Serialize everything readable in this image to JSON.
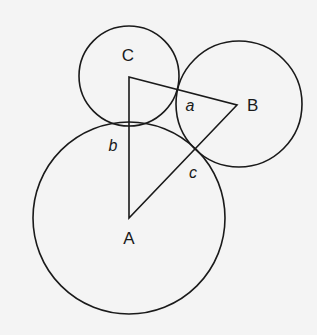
{
  "diagram": {
    "vertices": {
      "A": {
        "label": "A",
        "x": 129,
        "y": 218
      },
      "B": {
        "label": "B",
        "x": 237,
        "y": 105
      },
      "C": {
        "label": "C",
        "x": 129,
        "y": 77
      }
    },
    "circles": [
      {
        "name": "circle-a",
        "center": "A",
        "cx": 129,
        "cy": 218,
        "r": 96
      },
      {
        "name": "circle-b",
        "center": "B",
        "cx": 239,
        "cy": 104,
        "r": 63
      },
      {
        "name": "circle-c",
        "center": "C",
        "cx": 129,
        "cy": 76,
        "r": 50
      }
    ],
    "radius_labels": {
      "a": "a",
      "b": "b",
      "c": "c"
    },
    "colors": {
      "stroke": "#1a1a1a",
      "background": "#f4f4f4"
    }
  }
}
